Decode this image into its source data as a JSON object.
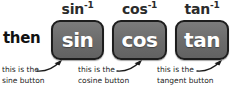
{
  "canvas": {
    "width": 237,
    "height": 90,
    "background": "#ffffff"
  },
  "connector": {
    "label": "then"
  },
  "style": {
    "key_fill": "#6e6e6e",
    "key_border": "#1d1d1d",
    "key_text": "#ffffff",
    "text_color": "#1b1b1b",
    "inverse_label_color": "#2b2b2b"
  },
  "keys": [
    {
      "name": "sin",
      "key_label": "sin",
      "inverse_base": "sin",
      "inverse_exponent": "-1",
      "caption_line1": "this is the",
      "caption_line2": "sine button"
    },
    {
      "name": "cos",
      "key_label": "cos",
      "inverse_base": "cos",
      "inverse_exponent": "-1",
      "caption_line1": "this is the",
      "caption_line2": "cosine button"
    },
    {
      "name": "tan",
      "key_label": "tan",
      "inverse_base": "tan",
      "inverse_exponent": "-1",
      "caption_line1": "this is the",
      "caption_line2": "tangent button"
    }
  ]
}
